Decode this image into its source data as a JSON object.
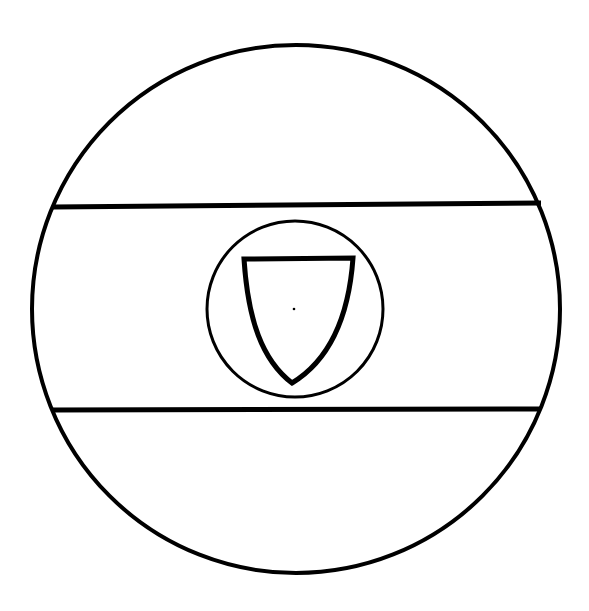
{
  "figure": {
    "description": "Heraldic roundel with horizontal fess band and central shield within a circle",
    "colors": {
      "background": "#ffffff",
      "stroke": "#000000"
    },
    "outer_circle": {
      "cx": 296,
      "cy": 309,
      "r": 265
    },
    "band": {
      "top_y_left": 207,
      "top_y_right": 203,
      "bottom_y": 410
    },
    "inner_circle": {
      "cx": 294,
      "cy": 309,
      "r": 88
    },
    "shield": {
      "center_dot": [
        294,
        309
      ]
    }
  }
}
